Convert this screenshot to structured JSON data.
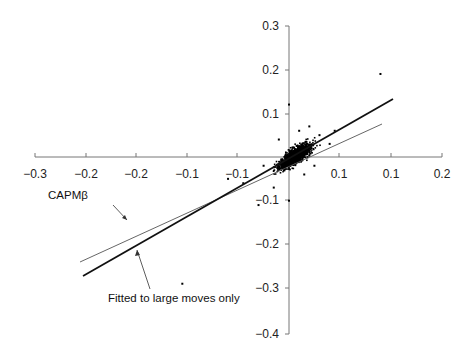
{
  "chart_data": {
    "type": "scatter",
    "title": "",
    "xlabel": "",
    "ylabel": "",
    "xlim": [
      -0.3,
      0.2
    ],
    "ylim": [
      -0.4,
      0.3
    ],
    "grid": false,
    "legend": null,
    "x_tick_labels": [
      "-0.3",
      "-0.2",
      "-0.2",
      "-0.1",
      "-0.1",
      "0.1",
      "0.1",
      "0.2"
    ],
    "y_tick_labels": [
      "0.3",
      "0.2",
      "0.1",
      "-0.1",
      "-0.2",
      "-0.3",
      "-0.4"
    ],
    "series": [
      {
        "name": "Returns",
        "kind": "scatter",
        "description": "Dense cluster of daily return pairs centered near origin (x approx -0.02..0.05, y approx -0.06..0.06) with sparse outliers",
        "points": [
          [
            -0.21,
            -0.29
          ],
          [
            0.18,
            0.19
          ],
          [
            0.0,
            0.12
          ],
          [
            -0.09,
            -0.06
          ],
          [
            -0.12,
            -0.05
          ],
          [
            -0.06,
            -0.11
          ],
          [
            0.04,
            0.07
          ],
          [
            0.06,
            0.05
          ],
          [
            0.0,
            -0.1
          ],
          [
            -0.03,
            -0.07
          ],
          [
            0.03,
            -0.04
          ],
          [
            -0.05,
            -0.02
          ],
          [
            0.08,
            0.03
          ],
          [
            0.02,
            0.06
          ],
          [
            -0.02,
            0.04
          ],
          [
            0.05,
            -0.02
          ],
          [
            0.09,
            0.06
          ]
        ]
      },
      {
        "name": "CAPMβ",
        "kind": "line",
        "style": "thin",
        "x": [
          -0.21,
          0.12
        ],
        "y": [
          -0.21,
          0.09
        ]
      },
      {
        "name": "Fitted to large moves only",
        "kind": "line",
        "style": "thick",
        "x": [
          -0.2,
          0.13
        ],
        "y": [
          -0.24,
          0.13
        ]
      }
    ],
    "annotations": [
      {
        "text": "CAPMβ",
        "points_to": "thin line"
      },
      {
        "text": "Fitted to large moves only",
        "points_to": "thick line"
      }
    ]
  },
  "labels": {
    "capm": "CAPMβ",
    "fitted": "Fitted to large moves only"
  }
}
